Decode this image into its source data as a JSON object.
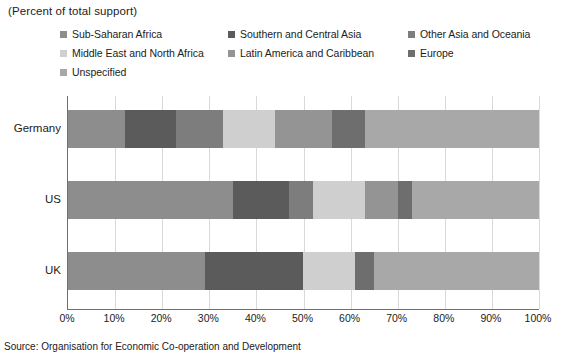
{
  "subtitle": "(Percent of total support)",
  "source": "Source: Organisation for Economic Co-operation and Development",
  "chart_data": {
    "type": "bar",
    "orientation": "horizontal",
    "stacked": true,
    "title": "",
    "subtitle": "(Percent of total support)",
    "xlabel": "",
    "ylabel": "",
    "xlim": [
      0,
      100
    ],
    "xtick_labels": [
      "0%",
      "10%",
      "20%",
      "30%",
      "40%",
      "50%",
      "60%",
      "70%",
      "80%",
      "90%",
      "100%"
    ],
    "xtick_values": [
      0,
      10,
      20,
      30,
      40,
      50,
      60,
      70,
      80,
      90,
      100
    ],
    "grid": true,
    "legend_position": "top",
    "categories": [
      "Germany",
      "US",
      "UK"
    ],
    "series": [
      {
        "name": "Sub-Saharan Africa",
        "color": "#8d8d8d",
        "values": [
          12,
          35,
          29
        ]
      },
      {
        "name": "Southern and Central Asia",
        "color": "#5b5b5b",
        "values": [
          11,
          12,
          21
        ]
      },
      {
        "name": "Other Asia and Oceania",
        "color": "#7d7d7d",
        "values": [
          10,
          5,
          0
        ]
      },
      {
        "name": "Middle East and North Africa",
        "color": "#cfcfcf",
        "values": [
          11,
          11,
          11
        ]
      },
      {
        "name": "Latin America and Caribbean",
        "color": "#949494",
        "values": [
          12,
          7,
          0
        ]
      },
      {
        "name": "Europe",
        "color": "#6e6e6e",
        "values": [
          7,
          3,
          4
        ]
      },
      {
        "name": "Unspecified",
        "color": "#a8a8a8",
        "values": [
          37,
          27,
          35
        ]
      }
    ]
  }
}
